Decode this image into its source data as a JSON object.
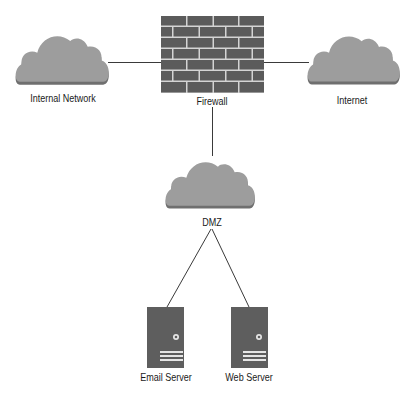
{
  "diagram": {
    "nodes": {
      "internal_network": {
        "label": "Internal Network",
        "type": "cloud"
      },
      "firewall": {
        "label": "Firewall",
        "type": "firewall"
      },
      "internet": {
        "label": "Internet",
        "type": "cloud"
      },
      "dmz": {
        "label": "DMZ",
        "type": "cloud"
      },
      "email_server": {
        "label": "Email Server",
        "type": "server"
      },
      "web_server": {
        "label": "Web Server",
        "type": "server"
      }
    },
    "edges": [
      {
        "from": "internal_network",
        "to": "firewall"
      },
      {
        "from": "firewall",
        "to": "internet"
      },
      {
        "from": "firewall",
        "to": "dmz"
      },
      {
        "from": "dmz",
        "to": "email_server"
      },
      {
        "from": "dmz",
        "to": "web_server"
      }
    ],
    "colors": {
      "cloud_fill": "#9d9d9d",
      "cloud_shadow": "#6f6f6f",
      "brick": "#5b5b5b",
      "mortar": "#d4d4d4",
      "server": "#5e5e5e",
      "line": "#3a3a3a"
    }
  }
}
